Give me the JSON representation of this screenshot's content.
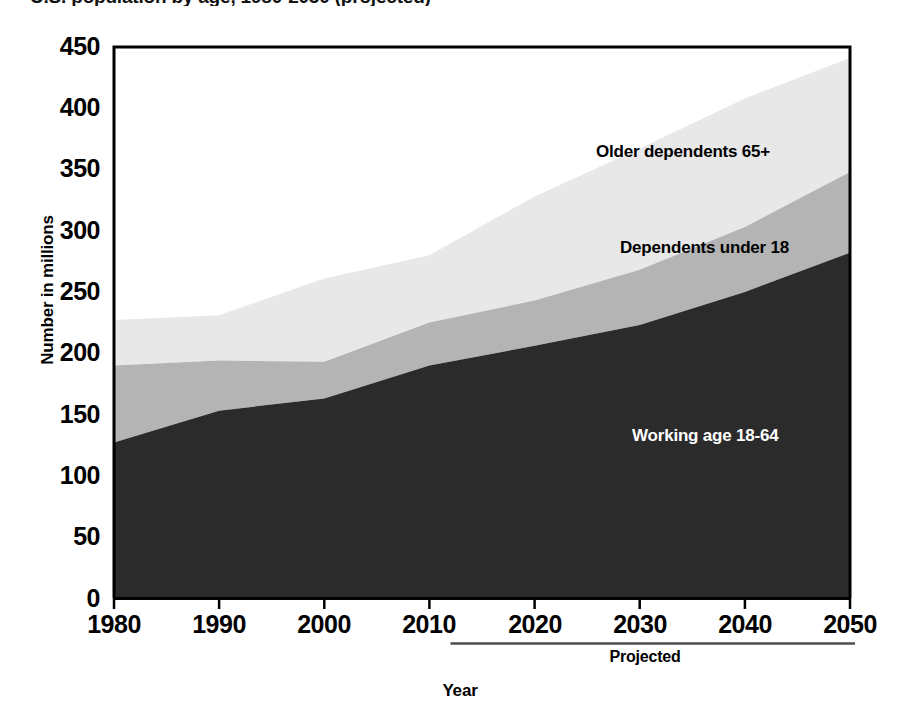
{
  "chart_data": {
    "type": "area",
    "title": "U.S. population by age, 1980-2050 (projected)",
    "xlabel": "Year",
    "ylabel": "Number in millions",
    "xlim": [
      1980,
      2050
    ],
    "ylim": [
      0,
      450
    ],
    "xticks": [
      "1980",
      "1990",
      "2000",
      "2010",
      "2020",
      "2030",
      "2040",
      "2050"
    ],
    "yticks": [
      "0",
      "50",
      "100",
      "150",
      "200",
      "250",
      "300",
      "350",
      "400",
      "450"
    ],
    "grid": false,
    "legend_position": "inside-plot-annotations",
    "stacked": true,
    "x": [
      1980,
      1990,
      2000,
      2010,
      2020,
      2030,
      2040,
      2050
    ],
    "series": [
      {
        "name": "Working age 18-64",
        "color": "#2b2b2b",
        "values": [
          127,
          153,
          163,
          190,
          206,
          223,
          250,
          282
        ]
      },
      {
        "name": "Dependents under 18",
        "color": "#b4b4b4",
        "values": [
          63,
          41,
          30,
          35,
          37,
          45,
          53,
          66
        ]
      },
      {
        "name": "Older dependents 65+",
        "color": "#e8e8e8",
        "values": [
          37,
          37,
          68,
          55,
          85,
          99,
          105,
          93
        ]
      }
    ],
    "cumulative": {
      "working_age_top": [
        127,
        153,
        163,
        190,
        206,
        223,
        250,
        282
      ],
      "under18_top": [
        190,
        194,
        193,
        225,
        243,
        268,
        303,
        348
      ],
      "total_population_top": [
        227,
        231,
        261,
        280,
        328,
        367,
        408,
        441
      ]
    },
    "annotations": [
      {
        "name": "projected-divider",
        "text": "Projected",
        "start_year": 2012,
        "end_year": 2050
      }
    ]
  },
  "axes": {
    "y_title": "Number in millions",
    "x_title": "Year",
    "y_ticks": [
      {
        "label": "450",
        "value": 450
      },
      {
        "label": "400",
        "value": 400
      },
      {
        "label": "350",
        "value": 350
      },
      {
        "label": "300",
        "value": 300
      },
      {
        "label": "250",
        "value": 250
      },
      {
        "label": "200",
        "value": 200
      },
      {
        "label": "150",
        "value": 150
      },
      {
        "label": "100",
        "value": 100
      },
      {
        "label": "50",
        "value": 50
      },
      {
        "label": "0",
        "value": 0
      }
    ],
    "x_ticks": [
      {
        "label": "1980",
        "value": 1980
      },
      {
        "label": "1990",
        "value": 1990
      },
      {
        "label": "2000",
        "value": 2000
      },
      {
        "label": "2010",
        "value": 2010
      },
      {
        "label": "2020",
        "value": 2020
      },
      {
        "label": "2030",
        "value": 2030
      },
      {
        "label": "2040",
        "value": 2040
      },
      {
        "label": "2050",
        "value": 2050
      }
    ]
  },
  "labels": {
    "older_dependents": "Older dependents 65+",
    "dependents_under_18": "Dependents under 18",
    "working_age": "Working age 18-64",
    "projected": "Projected"
  },
  "title": {
    "text": ""
  },
  "colors": {
    "band_older": "#e8e8e8",
    "band_under18": "#b4b4b4",
    "band_working": "#2b2b2b",
    "axis": "#000000",
    "background": "#ffffff"
  }
}
